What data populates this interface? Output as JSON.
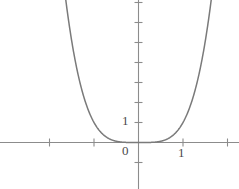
{
  "figure": {
    "background_color": "#ffffff",
    "curve_color": "#7a7a7a",
    "axis_color": "#8c8c8c",
    "label_color": "#4a4a4a"
  },
  "labels": {
    "origin": "0",
    "y_one": "1",
    "x_one": "1"
  },
  "chart_data": {
    "type": "line",
    "title": "",
    "xlabel": "",
    "ylabel": "",
    "function": "y = x^4",
    "grid": false,
    "legend_position": "none",
    "xlim": [
      -2.2,
      2.2
    ],
    "ylim": [
      -1.1,
      7.2
    ],
    "xticks": [
      -2,
      -1,
      0,
      1,
      2
    ],
    "yticks": [
      -1,
      0,
      1,
      2,
      3,
      4,
      5,
      6,
      7
    ],
    "xtick_labels": [
      "",
      "",
      "0",
      "1",
      ""
    ],
    "ytick_labels": [
      "",
      "",
      "1",
      "",
      "",
      "",
      "",
      "",
      ""
    ],
    "x": [
      -1.64,
      -1.55,
      -1.45,
      -1.35,
      -1.25,
      -1.15,
      -1.05,
      -0.95,
      -0.85,
      -0.75,
      -0.65,
      -0.55,
      -0.45,
      -0.35,
      -0.25,
      -0.15,
      -0.05,
      0.05,
      0.15,
      0.25,
      0.35,
      0.45,
      0.55,
      0.65,
      0.75,
      0.85,
      0.95,
      1.05,
      1.15,
      1.25,
      1.35,
      1.45,
      1.55,
      1.64
    ],
    "y": [
      7.24,
      5.77,
      4.42,
      3.32,
      2.44,
      1.75,
      1.22,
      0.81,
      0.52,
      0.32,
      0.18,
      0.09,
      0.04,
      0.015,
      0.004,
      0.0005,
      0.0,
      0.0,
      0.0005,
      0.004,
      0.015,
      0.04,
      0.09,
      0.18,
      0.32,
      0.52,
      0.81,
      1.22,
      1.75,
      2.44,
      3.32,
      4.42,
      5.77,
      7.24
    ],
    "series": [
      {
        "name": "y = x^4",
        "color": "#7a7a7a"
      }
    ]
  }
}
